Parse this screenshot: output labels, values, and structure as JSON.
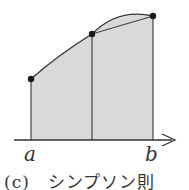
{
  "diagram": {
    "type": "numerical-integration-illustration",
    "method": "Simpson's rule",
    "labels": {
      "a": "a",
      "b": "b",
      "caption": "(c)　シンプソン則"
    },
    "points": [
      {
        "x": 31,
        "y": 79
      },
      {
        "x": 92,
        "y": 34
      },
      {
        "x": 153,
        "y": 16
      }
    ],
    "axis": {
      "y": 140,
      "x_start": 14,
      "x_end": 175
    },
    "colors": {
      "fill": "#d9d9d9",
      "stroke": "#333333",
      "point": "#1a1a1a"
    }
  }
}
